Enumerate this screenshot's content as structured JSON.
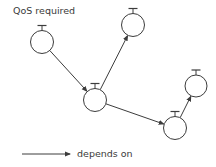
{
  "colors": {
    "stroke": "#3c3c3c",
    "text": "#3a3a3a",
    "background": "#ffffff"
  },
  "labels": {
    "qos": "QoS required",
    "legend": "depends on"
  },
  "nodes": [
    {
      "id": "n1",
      "cx": 42,
      "cy": 42,
      "r": 11.5,
      "qos_marker": true
    },
    {
      "id": "n2",
      "cx": 95,
      "cy": 100,
      "r": 11.5,
      "qos_marker": true
    },
    {
      "id": "n3",
      "cx": 133,
      "cy": 25,
      "r": 11.5,
      "qos_marker": true
    },
    {
      "id": "n4",
      "cx": 196,
      "cy": 86,
      "r": 11,
      "qos_marker": true
    },
    {
      "id": "n5",
      "cx": 175,
      "cy": 128,
      "r": 11.5,
      "qos_marker": true
    }
  ],
  "edges": [
    {
      "from": "n1",
      "to": "n2",
      "label": "depends on"
    },
    {
      "from": "n2",
      "to": "n3",
      "label": "depends on"
    },
    {
      "from": "n2",
      "to": "n5",
      "label": "depends on"
    },
    {
      "from": "n5",
      "to": "n4",
      "label": "depends on"
    }
  ]
}
